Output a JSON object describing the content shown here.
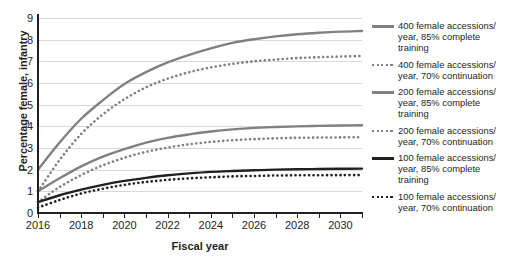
{
  "chart_data": {
    "type": "line",
    "title": "",
    "xlabel": "Fiscal year",
    "ylabel": "Percentage female, infantry",
    "xlim": [
      2016,
      2031
    ],
    "ylim": [
      0,
      9
    ],
    "xticks": [
      2016,
      2018,
      2020,
      2022,
      2024,
      2026,
      2028,
      2030
    ],
    "xtick_minor_step": 1,
    "yticks": [
      0,
      1,
      2,
      3,
      4,
      5,
      6,
      7,
      8,
      9
    ],
    "grid": "horizontal",
    "legend_position": "right",
    "x": [
      2016,
      2017,
      2018,
      2019,
      2020,
      2021,
      2022,
      2023,
      2024,
      2025,
      2026,
      2027,
      2028,
      2029,
      2030,
      2031
    ],
    "series": [
      {
        "name": "400 female accessions/year, 85% complete training",
        "style": "solid",
        "color": "#808080",
        "values": [
          2.0,
          3.25,
          4.35,
          5.2,
          5.95,
          6.5,
          6.95,
          7.3,
          7.6,
          7.85,
          8.02,
          8.15,
          8.25,
          8.32,
          8.37,
          8.4
        ]
      },
      {
        "name": "400 female accessions/year, 70% continuation",
        "style": "dotted",
        "color": "#808080",
        "values": [
          1.0,
          2.45,
          3.65,
          4.55,
          5.25,
          5.8,
          6.2,
          6.5,
          6.72,
          6.88,
          7.0,
          7.08,
          7.15,
          7.19,
          7.22,
          7.25
        ]
      },
      {
        "name": "200 female accessions/year, 85% complete training",
        "style": "solid",
        "color": "#808080",
        "values": [
          1.0,
          1.6,
          2.15,
          2.6,
          2.95,
          3.25,
          3.47,
          3.63,
          3.76,
          3.86,
          3.93,
          3.97,
          4.0,
          4.02,
          4.04,
          4.05
        ]
      },
      {
        "name": "200 female accessions/year, 70% continuation",
        "style": "dotted",
        "color": "#808080",
        "values": [
          0.5,
          1.2,
          1.75,
          2.2,
          2.55,
          2.82,
          3.02,
          3.17,
          3.28,
          3.36,
          3.41,
          3.45,
          3.47,
          3.48,
          3.49,
          3.5
        ]
      },
      {
        "name": "100 female accessions/year, 85% complete training",
        "style": "solid",
        "color": "#231f20",
        "values": [
          0.5,
          0.82,
          1.08,
          1.3,
          1.48,
          1.62,
          1.74,
          1.83,
          1.9,
          1.94,
          1.97,
          2.0,
          2.02,
          2.03,
          2.04,
          2.05
        ]
      },
      {
        "name": "100 female accessions/year, 70% continuation",
        "style": "dotted",
        "color": "#231f20",
        "values": [
          0.25,
          0.6,
          0.9,
          1.12,
          1.3,
          1.43,
          1.53,
          1.6,
          1.65,
          1.69,
          1.71,
          1.73,
          1.74,
          1.745,
          1.748,
          1.75
        ]
      }
    ],
    "legend": [
      {
        "label_line1": "400 female accessions/",
        "label_line2": "year, 85% complete",
        "label_line3": "training",
        "style": "solid",
        "color": "#808080"
      },
      {
        "label_line1": "400 female accessions/",
        "label_line2": "year, 70% continuation",
        "label_line3": "",
        "style": "dotted",
        "color": "#808080"
      },
      {
        "label_line1": "200 female accessions/",
        "label_line2": "year, 85% complete",
        "label_line3": "training",
        "style": "solid",
        "color": "#808080"
      },
      {
        "label_line1": "200 female accessions/",
        "label_line2": "year, 70% continuation",
        "label_line3": "",
        "style": "dotted",
        "color": "#808080"
      },
      {
        "label_line1": "100 female accessions/",
        "label_line2": "year, 85% complete",
        "label_line3": "training",
        "style": "solid",
        "color": "#231f20"
      },
      {
        "label_line1": "100 female accessions/",
        "label_line2": "year, 70% continuation",
        "label_line3": "",
        "style": "dotted",
        "color": "#231f20"
      }
    ]
  }
}
